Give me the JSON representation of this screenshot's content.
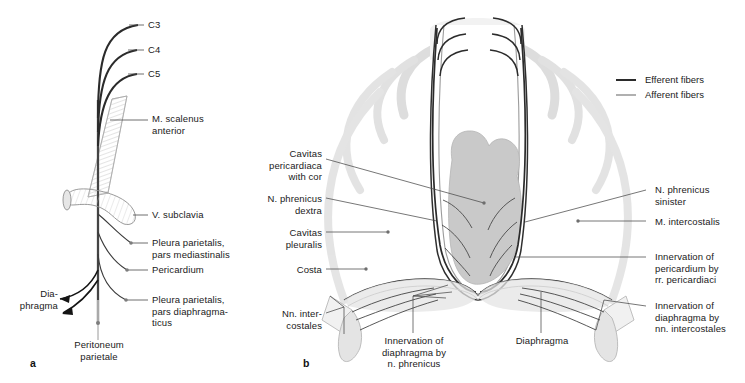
{
  "figure": {
    "colors": {
      "efferent": "#2b2b2b",
      "afferent": "#b0b0b0",
      "heart_fill": "#c9c9c9",
      "leader_line": "#4a4a4a",
      "muscle_fill": "#e2e2e2",
      "bone_fill": "#ededed",
      "text": "#1a1a1a",
      "background": "#ffffff"
    }
  },
  "legend": {
    "items": [
      {
        "label": "Efferent fibers",
        "swatch": "efferent-line-swatch",
        "color": "#2b2b2b"
      },
      {
        "label": "Afferent fibers",
        "swatch": "afferent-line-swatch",
        "color": "#b0b0b0"
      }
    ]
  },
  "panel_a": {
    "letter": "a",
    "labels": {
      "c3": "C3",
      "c4": "C4",
      "c5": "C5",
      "scalenus": "M. scalenus\nanterior",
      "subclavia": "V. subclavia",
      "pleura_med": "Pleura parietalis,\npars mediastinalis",
      "pericardium": "Pericardium",
      "pleura_diaph": "Pleura parietalis,\npars diaphragma-\nticus",
      "diaphragma": "Dia-\nphragma",
      "peritoneum": "Peritoneum\nparietale"
    }
  },
  "panel_b": {
    "letter": "b",
    "labels": {
      "cavitas_pericardiaca": "Cavitas\npericardiaca\nwith cor",
      "n_phrenicus_dextra": "N. phrenicus\ndextra",
      "cavitas_pleuralis": "Cavitas\npleuralis",
      "costa": "Costa",
      "nn_intercostales": "Nn. inter-\ncostales",
      "innervation_phrenicus": "Innervation of\ndiaphragma by\nn. phrenicus",
      "diaphragma": "Diaphragma",
      "n_phrenicus_sinister": "N. phrenicus\nsinister",
      "m_intercostalis": "M. intercostalis",
      "innervation_pericardium": "Innervation of\npericardium by\nrr. pericardiaci",
      "innervation_intercostales": "Innervation of\ndiaphragma by\nnn. intercostales"
    }
  }
}
